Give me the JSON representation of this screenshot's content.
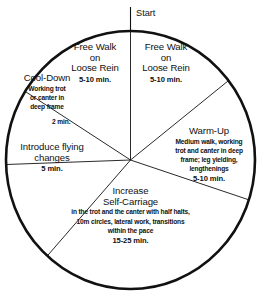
{
  "diagram": {
    "type": "pie-wheel",
    "title_marker": "Start",
    "stroke_color": "#111111",
    "background_color": "#ffffff",
    "outer_ring_width_px": 2.6,
    "divider_width_px": 0.9,
    "center": {
      "x": 130.5,
      "y": 160
    },
    "radius": {
      "x": 124.5,
      "y": 129
    },
    "segments": [
      {
        "id": "free-walk-right",
        "heading": "Free Walk",
        "heading_line2": "on",
        "heading_line3": "Loose Rein",
        "detail": "",
        "time": "5-10 min.",
        "start_angle_deg": 0,
        "end_angle_deg": 52
      },
      {
        "id": "warm-up",
        "heading": "Warm-Up",
        "heading_line2": "",
        "heading_line3": "",
        "detail": "Medium walk, working trot and canter in deep frame; leg yielding, lengthenings",
        "time": "5-10 min.",
        "start_angle_deg": 52,
        "end_angle_deg": 108
      },
      {
        "id": "increase-self-carriage",
        "heading": "Increase",
        "heading_line2": "Self-Carriage",
        "heading_line3": "",
        "detail": "in the trot and the canter with half halts, 10m circles, lateral work, transitions within the pace",
        "time": "15-25 min.",
        "start_angle_deg": 108,
        "end_angle_deg": 222
      },
      {
        "id": "introduce-flying-changes",
        "heading": "Introduce flying",
        "heading_line2": "changes",
        "heading_line3": "",
        "detail": "",
        "time": "5 min.",
        "start_angle_deg": 222,
        "end_angle_deg": 268
      },
      {
        "id": "cool-down",
        "heading": "Cool-Down",
        "heading_line2": "",
        "heading_line3": "",
        "detail": "Working trot or canter in deep frame",
        "time": "2 min.",
        "start_angle_deg": 268,
        "end_angle_deg": 302
      },
      {
        "id": "free-walk-left",
        "heading": "Free Walk",
        "heading_line2": "on",
        "heading_line3": "Loose Rein",
        "detail": "",
        "time": "5-10 min.",
        "start_angle_deg": 302,
        "end_angle_deg": 360
      }
    ]
  },
  "start_marker": {
    "label": "Start"
  },
  "labels": {
    "free_walk_left": {
      "line1": "Free Walk",
      "line2": "on",
      "line3": "Loose Rein",
      "time": "5-10 min."
    },
    "free_walk_right": {
      "line1": "Free Walk",
      "line2": "on",
      "line3": "Loose Rein",
      "time": "5-10 min."
    },
    "warm_up": {
      "heading": "Warm-Up",
      "detail_line1": "Medium walk, working",
      "detail_line2": "trot and canter in deep",
      "detail_line3": "frame; leg yielding,",
      "detail_line4": "lengthenings",
      "time": "5-10 min."
    },
    "increase_self_carriage": {
      "heading_line1": "Increase",
      "heading_line2": "Self-Carriage",
      "detail_line1": "in the trot and the canter with half halts,",
      "detail_line2": "10m circles, lateral work, transitions",
      "detail_line3": "within the pace",
      "time": "15-25 min."
    },
    "introduce_flying_changes": {
      "heading_line1": "Introduce flying",
      "heading_line2": "changes",
      "time": "5 min."
    },
    "cool_down": {
      "heading": "Cool-Down",
      "detail_line1": "Working trot",
      "detail_line2": "or canter in",
      "detail_line3": "deep frame",
      "time": "2 min."
    }
  }
}
